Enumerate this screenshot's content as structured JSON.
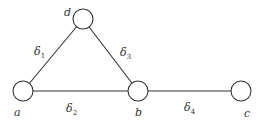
{
  "diagram": {
    "type": "graph",
    "nodes": [
      {
        "id": "a",
        "label": "a",
        "cx": 23,
        "cy": 91,
        "r": 10,
        "label_x": 14,
        "label_y": 116
      },
      {
        "id": "b",
        "label": "b",
        "cx": 138,
        "cy": 91,
        "r": 10,
        "label_x": 135,
        "label_y": 116
      },
      {
        "id": "c",
        "label": "c",
        "cx": 241,
        "cy": 91,
        "r": 10,
        "label_x": 244,
        "label_y": 117
      },
      {
        "id": "d",
        "label": "d",
        "cx": 83,
        "cy": 19,
        "r": 10,
        "label_x": 64,
        "label_y": 16
      }
    ],
    "edges": [
      {
        "id": "e1",
        "from": "a",
        "to": "d",
        "label": "δ",
        "sub": "1",
        "lx": 34,
        "ly": 55
      },
      {
        "id": "e2",
        "from": "a",
        "to": "b",
        "label": "δ",
        "sub": "2",
        "lx": 66,
        "ly": 112
      },
      {
        "id": "e3",
        "from": "d",
        "to": "b",
        "label": "δ",
        "sub": "3",
        "lx": 120,
        "ly": 56
      },
      {
        "id": "e4",
        "from": "b",
        "to": "c",
        "label": "δ",
        "sub": "4",
        "lx": 184,
        "ly": 111
      }
    ]
  }
}
